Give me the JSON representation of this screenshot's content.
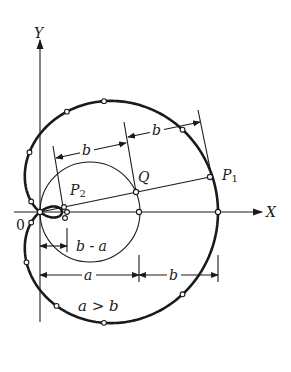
{
  "diagram": {
    "type": "limacon-construction",
    "axes": {
      "x_label": "X",
      "y_label": "Y",
      "origin_label": "0"
    },
    "points": {
      "p1": "P",
      "p1_sub": "1",
      "p2": "P",
      "p2_sub": "2",
      "q": "Q"
    },
    "dimensions": {
      "top_left": "b",
      "top_right": "b",
      "inner": "b - a",
      "bottom_left": "a",
      "bottom_right": "b"
    },
    "condition": "a > b",
    "colors": {
      "ink": "#1a1a1a",
      "background": "#ffffff"
    }
  }
}
